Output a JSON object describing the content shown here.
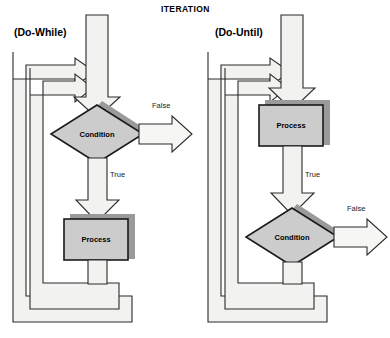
{
  "diagram": {
    "title": "ITERATION",
    "colors": {
      "arrow_fill": "#f2f2f0",
      "shape_fill": "#cccccc",
      "shadow": "#9a9a9a",
      "outline": "#1a1a1a",
      "text": "#000000",
      "background": "#ffffff"
    },
    "charts": [
      {
        "id": "do-while",
        "label": "(Do-While)",
        "nodes": [
          {
            "id": "condition",
            "type": "decision",
            "text": "Condition"
          },
          {
            "id": "process",
            "type": "process",
            "text": "Process"
          }
        ],
        "edges": [
          {
            "from": "condition",
            "to": "exit",
            "label": "False"
          },
          {
            "from": "condition",
            "to": "process",
            "label": "True"
          }
        ]
      },
      {
        "id": "do-until",
        "label": "(Do-Until)",
        "nodes": [
          {
            "id": "process",
            "type": "process",
            "text": "Process"
          },
          {
            "id": "condition",
            "type": "decision",
            "text": "Condition"
          }
        ],
        "edges": [
          {
            "from": "process",
            "to": "condition",
            "label": "True"
          },
          {
            "from": "condition",
            "to": "exit",
            "label": "False"
          }
        ]
      }
    ]
  }
}
